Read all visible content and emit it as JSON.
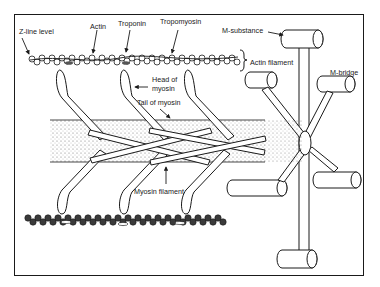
{
  "diagram": {
    "labels": {
      "z_line": "Z-line level",
      "actin": "Actin",
      "troponin": "Troponin",
      "tropomyosin": "Tropomyosin",
      "m_substance": "M-substance",
      "actin_filament": "Actin filament",
      "head_of_myosin_1": "Head of",
      "head_of_myosin_2": "myosin",
      "tail_of_myosin": "Tail of myosin",
      "m_bridge": "M-bridge",
      "myosin_filament": "Myosin filament"
    },
    "colors": {
      "ink": "#1a1a1a",
      "bead_light": "#ffffff",
      "bead_dark": "#3a3a3a",
      "stipple": "#6a6a6a"
    }
  }
}
